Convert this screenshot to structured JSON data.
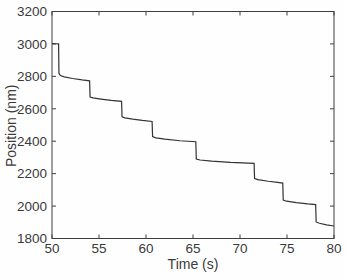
{
  "figure": {
    "background": "#fefefe",
    "axis_color": "#3f3f3f",
    "text_color": "#3a3a3a",
    "line_color": "#333333"
  },
  "chart_data": {
    "type": "line",
    "title": "",
    "xlabel": "Time (s)",
    "ylabel": "Position (nm)",
    "xlim": [
      50,
      80
    ],
    "ylim": [
      1800,
      3200
    ],
    "xticks": [
      50,
      55,
      60,
      65,
      70,
      75,
      80
    ],
    "yticks": [
      1800,
      2000,
      2200,
      2400,
      2600,
      2800,
      3000,
      3200
    ],
    "grid": false,
    "legend": null,
    "series": [
      {
        "name": "position-trace",
        "color": "#333333",
        "points": [
          [
            50.0,
            3002
          ],
          [
            50.4,
            3001
          ],
          [
            50.7,
            3000
          ],
          [
            50.74,
            2818
          ],
          [
            50.9,
            2805
          ],
          [
            51.3,
            2797
          ],
          [
            52.2,
            2787
          ],
          [
            53.2,
            2778
          ],
          [
            54.0,
            2772
          ],
          [
            54.05,
            2673
          ],
          [
            54.35,
            2667
          ],
          [
            55.2,
            2660
          ],
          [
            56.3,
            2652
          ],
          [
            57.4,
            2646
          ],
          [
            57.45,
            2551
          ],
          [
            57.75,
            2544
          ],
          [
            58.6,
            2536
          ],
          [
            59.6,
            2528
          ],
          [
            60.65,
            2522
          ],
          [
            60.7,
            2428
          ],
          [
            61.05,
            2421
          ],
          [
            62.0,
            2413
          ],
          [
            63.6,
            2403
          ],
          [
            65.3,
            2397
          ],
          [
            65.35,
            2290
          ],
          [
            65.75,
            2284
          ],
          [
            67.0,
            2277
          ],
          [
            69.0,
            2269
          ],
          [
            71.5,
            2263
          ],
          [
            71.55,
            2170
          ],
          [
            71.9,
            2163
          ],
          [
            73.0,
            2153
          ],
          [
            74.0,
            2146
          ],
          [
            74.55,
            2142
          ],
          [
            74.6,
            2037
          ],
          [
            74.95,
            2030
          ],
          [
            76.0,
            2021
          ],
          [
            77.2,
            2013
          ],
          [
            78.05,
            2009
          ],
          [
            78.1,
            1902
          ],
          [
            78.45,
            1894
          ],
          [
            79.2,
            1884
          ],
          [
            80.0,
            1877
          ]
        ]
      }
    ]
  }
}
